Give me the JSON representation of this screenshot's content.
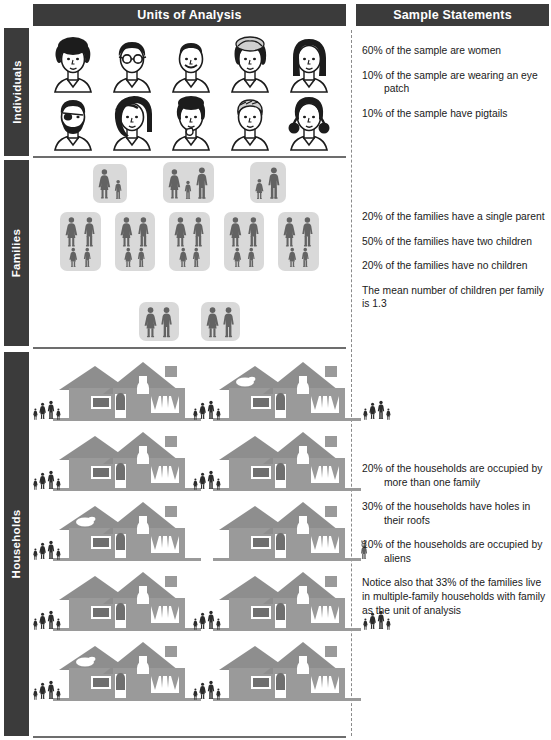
{
  "header": {
    "units_of_analysis": "Units of Analysis",
    "sample_statements": "Sample Statements"
  },
  "rows": [
    {
      "label": "Individuals"
    },
    {
      "label": "Families"
    },
    {
      "label": "Households"
    }
  ],
  "statements": {
    "individuals": [
      "60% of the sample are women",
      "10% of the sample are wearing an eye patch",
      "10% of the sample have pigtails"
    ],
    "families": [
      "20% of the families have a single parent",
      "50% of the families have two children",
      "20% of the families have no children",
      "The mean number of children per family is 1.3"
    ],
    "households": [
      "20% of the households are occupied by more than one family",
      "30% of the households have holes in their roofs",
      "10% of the households are occupied by aliens",
      "Notice also that 33% of the families live in multiple-family households with family as the unit of analysis"
    ]
  },
  "individuals": {
    "count": 10,
    "faces": [
      {
        "name": "woman-afro-hair",
        "pigtails": false,
        "eye_patch": false
      },
      {
        "name": "man-glasses",
        "pigtails": false,
        "eye_patch": false
      },
      {
        "name": "man-smiling",
        "pigtails": false,
        "eye_patch": false
      },
      {
        "name": "woman-curly-bob",
        "pigtails": false,
        "eye_patch": false
      },
      {
        "name": "woman-long-hair",
        "pigtails": false,
        "eye_patch": false
      },
      {
        "name": "man-beard-eye-patch",
        "pigtails": false,
        "eye_patch": true
      },
      {
        "name": "woman-long-dark-hair",
        "pigtails": false,
        "eye_patch": false
      },
      {
        "name": "woman-short-afro",
        "pigtails": false,
        "eye_patch": false
      },
      {
        "name": "man-short-hair",
        "pigtails": false,
        "eye_patch": false
      },
      {
        "name": "woman-pigtails",
        "pigtails": true,
        "eye_patch": false
      }
    ]
  },
  "families": {
    "count": 10,
    "groups": [
      {
        "row": 1,
        "adults": [
          "woman"
        ],
        "children": [
          "child"
        ]
      },
      {
        "row": 1,
        "adults": [
          "woman",
          "man"
        ],
        "children": [
          "child"
        ]
      },
      {
        "row": 1,
        "adults": [
          "man"
        ],
        "children": [
          "girl"
        ]
      },
      {
        "row": 2,
        "adults": [
          "woman",
          "man"
        ],
        "children": [
          "girl",
          "boy"
        ]
      },
      {
        "row": 2,
        "adults": [
          "woman",
          "man"
        ],
        "children": [
          "girl",
          "boy"
        ]
      },
      {
        "row": 2,
        "adults": [
          "woman",
          "man"
        ],
        "children": [
          "girl",
          "boy"
        ]
      },
      {
        "row": 2,
        "adults": [
          "woman",
          "man"
        ],
        "children": [
          "girl",
          "boy"
        ]
      },
      {
        "row": 2,
        "adults": [
          "woman",
          "man"
        ],
        "children": [
          "girl",
          "boy"
        ]
      },
      {
        "row": 3,
        "adults": [
          "woman",
          "man"
        ],
        "children": []
      },
      {
        "row": 3,
        "adults": [
          "woman",
          "man"
        ],
        "children": []
      }
    ]
  },
  "households": {
    "count": 10,
    "houses": [
      {
        "index": 1,
        "roof_hole": false,
        "families": 1,
        "alien": false,
        "left_group": 4,
        "right_group": 0
      },
      {
        "index": 2,
        "roof_hole": true,
        "families": 2,
        "alien": false,
        "left_group": 4,
        "right_group": 3
      },
      {
        "index": 3,
        "roof_hole": false,
        "families": 1,
        "alien": false,
        "left_group": 4,
        "right_group": 0
      },
      {
        "index": 4,
        "roof_hole": false,
        "families": 1,
        "alien": false,
        "left_group": 4,
        "right_group": 0
      },
      {
        "index": 5,
        "roof_hole": true,
        "families": 1,
        "alien": false,
        "left_group": 4,
        "right_group": 0
      },
      {
        "index": 6,
        "roof_hole": false,
        "families": 0,
        "alien": true,
        "left_group": 0,
        "right_group": 0
      },
      {
        "index": 7,
        "roof_hole": false,
        "families": 1,
        "alien": false,
        "left_group": 4,
        "right_group": 0
      },
      {
        "index": 8,
        "roof_hole": false,
        "families": 2,
        "alien": false,
        "left_group": 4,
        "right_group": 3
      },
      {
        "index": 9,
        "roof_hole": true,
        "families": 1,
        "alien": false,
        "left_group": 4,
        "right_group": 0
      },
      {
        "index": 10,
        "roof_hole": false,
        "families": 1,
        "alien": false,
        "left_group": 4,
        "right_group": 0
      }
    ]
  },
  "colors": {
    "header_bar": "#3b3b3b",
    "header_text": "#ffffff",
    "family_card": "#d9d9d9",
    "figure": "#636363",
    "house_body": "#9a9a9a",
    "house_roof": "#8a8a8a",
    "person_dark": "#2b2b2b",
    "divider": "#6d6d6d",
    "text": "#1a1a1a"
  }
}
